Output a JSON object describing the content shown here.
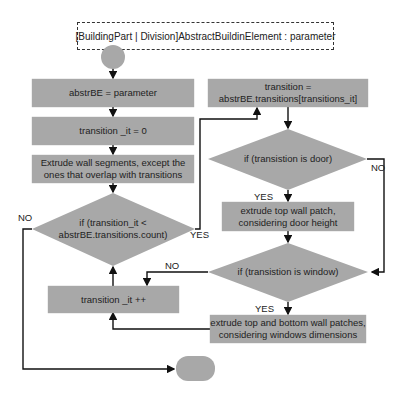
{
  "diagram": {
    "type": "flowchart",
    "parameter": "[BuildingPart | Division]AbstractBuildinElement : parameter",
    "nodes": {
      "assign_abstr": "abstrBE = parameter",
      "init_it": "transition _it = 0",
      "extrude_segments_1": "Extrude wall segments, except the",
      "extrude_segments_2": "ones that overlap with transitions",
      "loop_cond_1": "if (transition_it <",
      "loop_cond_2": "abstrBE.transitions.count)",
      "increment": "transition _it ++",
      "get_transition_1": "transition =",
      "get_transition_2": "abstrBE.transitions[transitions_it]",
      "door_cond": "if (transistion is door)",
      "door_action_1": "extrude top wall patch,",
      "door_action_2": "considering door height",
      "window_cond": "if (transistion is window)",
      "window_action_1": "extrude top and bottom wall patches,",
      "window_action_2": "considering windows dimensions"
    },
    "edge_labels": {
      "loop_no": "NO",
      "loop_yes": "YES",
      "door_yes": "YES",
      "door_no": "NO",
      "window_no": "NO",
      "window_yes": "YES"
    },
    "colors": {
      "node_fill": "#a8a8a8",
      "line": "#111111",
      "background": "#ffffff"
    }
  }
}
